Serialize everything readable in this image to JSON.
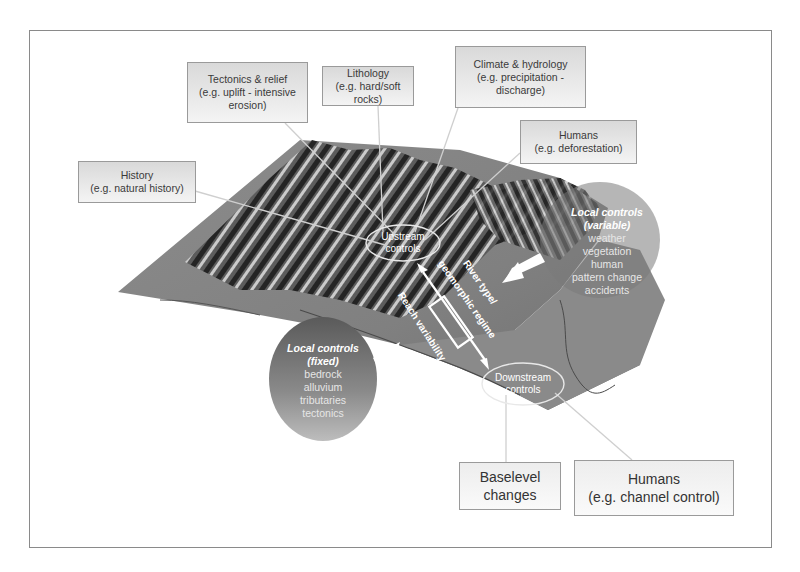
{
  "diagram": {
    "title_boxes": {
      "tectonics": {
        "title": "Tectonics & relief",
        "line2": "(e.g. uplift - intensive",
        "line3": "erosion)"
      },
      "lithology": {
        "title": "Lithology",
        "line2": "(e.g. hard/soft rocks)"
      },
      "climate": {
        "title": "Climate & hydrology",
        "line2": "(e.g. precipitation -",
        "line3": "discharge)"
      },
      "humans_upstream": {
        "title": "Humans",
        "line2": "(e.g. deforestation)"
      },
      "history": {
        "title": "History",
        "line2": "(e.g. natural history)"
      },
      "baselevel": {
        "title": "Baselevel",
        "line2": "changes"
      },
      "humans_downstream": {
        "title": "Humans",
        "line2": "(e.g. channel control)"
      }
    },
    "ellipses": {
      "upstream": {
        "line1": "Upstream",
        "line2": "controls"
      },
      "downstream": {
        "line1": "Downstream",
        "line2": "controls"
      }
    },
    "local_controls_fixed": {
      "heading1": "Local controls",
      "heading2": "(fixed)",
      "items": [
        "bedrock",
        "alluvium",
        "tributaries",
        "tectonics"
      ]
    },
    "local_controls_variable": {
      "heading1": "Local controls",
      "heading2": "(variable)",
      "items": [
        "weather",
        "vegetation",
        "human",
        "pattern change",
        "accidents"
      ]
    },
    "rotated_labels": {
      "river_type": "River type/",
      "regime": "geomorphic regime",
      "reach": "Reach variability"
    },
    "colors": {
      "terrain_dark": "#2e2e2e",
      "terrain_mid": "#7d7d7d",
      "terrain_light": "#a8a8a8",
      "box_border": "#9a9a9a",
      "connector": "#c8c8c8"
    }
  }
}
